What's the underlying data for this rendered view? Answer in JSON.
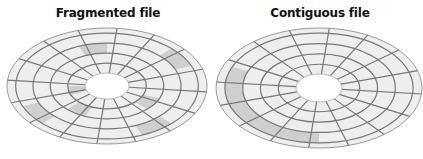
{
  "diagrams": [
    {
      "title": "Fragmented file",
      "tracks": 4,
      "sectors": 16,
      "highlighted": [
        [
          3,
          14
        ],
        [
          3,
          2
        ],
        [
          2,
          11
        ],
        [
          1,
          5
        ],
        [
          0,
          7
        ],
        [
          3,
          6
        ],
        [
          1,
          1
        ]
      ]
    },
    {
      "title": "Contiguous file",
      "tracks": 4,
      "sectors": 16,
      "highlighted": [
        [
          3,
          4
        ],
        [
          3,
          5
        ],
        [
          3,
          6
        ],
        [
          3,
          7
        ],
        [
          3,
          8
        ]
      ]
    }
  ],
  "colors": {
    "platter": "#eeeeee",
    "highlight": "#cfcfcf",
    "line": "#777777",
    "hole": "#ffffff"
  }
}
